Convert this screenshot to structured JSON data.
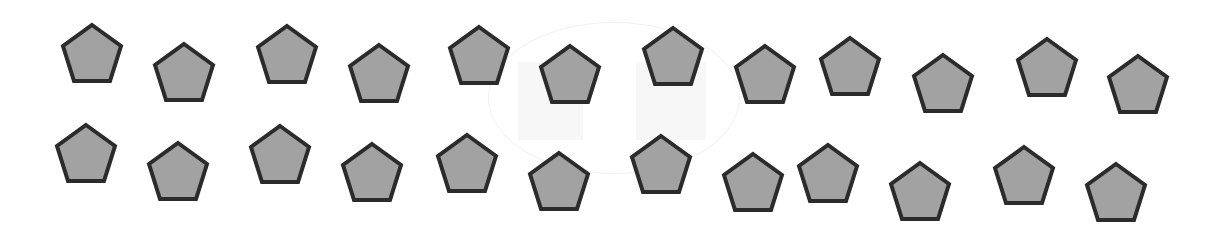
{
  "scene": {
    "description": "Two rows of identical gray pentagons with dark outlines",
    "background_color": "#ffffff",
    "shape_type": "pentagon",
    "fill_color": "#a2a2a2",
    "stroke_color": "#2b2b2b",
    "stroke_width": 4,
    "count_total": 24,
    "rows": [
      {
        "name": "top-row",
        "count": 12,
        "shapes": [
          {
            "x": 60,
            "y": 22
          },
          {
            "x": 152,
            "y": 41
          },
          {
            "x": 255,
            "y": 23
          },
          {
            "x": 347,
            "y": 42
          },
          {
            "x": 447,
            "y": 24
          },
          {
            "x": 538,
            "y": 43
          },
          {
            "x": 641,
            "y": 25
          },
          {
            "x": 733,
            "y": 43
          },
          {
            "x": 818,
            "y": 35
          },
          {
            "x": 911,
            "y": 52
          },
          {
            "x": 1015,
            "y": 36
          },
          {
            "x": 1106,
            "y": 53
          }
        ]
      },
      {
        "name": "bottom-row",
        "count": 12,
        "shapes": [
          {
            "x": 54,
            "y": 122
          },
          {
            "x": 146,
            "y": 140
          },
          {
            "x": 248,
            "y": 123
          },
          {
            "x": 340,
            "y": 141
          },
          {
            "x": 435,
            "y": 132
          },
          {
            "x": 527,
            "y": 150
          },
          {
            "x": 629,
            "y": 133
          },
          {
            "x": 721,
            "y": 151
          },
          {
            "x": 796,
            "y": 142
          },
          {
            "x": 888,
            "y": 160
          },
          {
            "x": 992,
            "y": 144
          },
          {
            "x": 1084,
            "y": 161
          }
        ]
      }
    ]
  }
}
